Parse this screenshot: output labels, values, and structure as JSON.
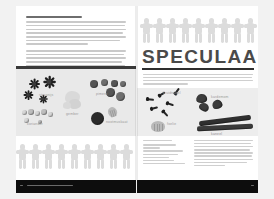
{
  "spread": {
    "background_color": "#f2f2f2",
    "page_color": "#ffffff",
    "footer_color": "#0d0d0d"
  },
  "left_page": {
    "heading": "SPECULAASKRUIDEN — de geur van winter",
    "paragraphs": [
      {
        "lines": 7
      },
      {
        "lines": 6
      }
    ],
    "photo_panel": {
      "background_color": "#e9e9e9",
      "top_rule_color": "#3a3a3a",
      "items": [
        {
          "name": "steranijs",
          "label": "steranijs",
          "icon": "star-anise-icon"
        },
        {
          "name": "koriander",
          "label": "koriander",
          "icon": "coriander-seed-icon"
        },
        {
          "name": "gember",
          "label": "gember",
          "icon": "ginger-root-icon"
        },
        {
          "name": "piment",
          "label": "piment",
          "icon": "allspice-berry-icon"
        },
        {
          "name": "nootmuskaat",
          "label": "nootmuskaat",
          "icon": "nutmeg-icon"
        }
      ]
    },
    "doll_chain": {
      "count": 9,
      "color": "#dcdcdc"
    }
  },
  "right_page": {
    "doll_chain": {
      "count": 9,
      "color": "#dcdcdc"
    },
    "title": "SPECULAAS",
    "title_color": "#4a4a4a",
    "rule_color": "#2e2e2e",
    "intro": {
      "lines": 4
    },
    "photo_panel": {
      "background_color": "#ededed",
      "items": [
        {
          "name": "kruidnagel",
          "label": "kruidnagel",
          "icon": "clove-icon"
        },
        {
          "name": "kardemom",
          "label": "kardemom",
          "icon": "cardamom-pod-icon"
        },
        {
          "name": "foelie",
          "label": "foelie",
          "icon": "mace-icon"
        },
        {
          "name": "kaneel",
          "label": "kaneel",
          "icon": "cinnamon-stick-icon"
        }
      ]
    },
    "recipe": {
      "ingredients_heading": "INGREDIËNTEN",
      "ingredient_lines": 7,
      "method_heading": "BEREIDING",
      "method_lines": 9
    }
  },
  "footers": {
    "left": {
      "page_number": "8",
      "caption": "SPECULAAS · winterbaksels"
    },
    "right": {
      "page_number": "9"
    }
  }
}
